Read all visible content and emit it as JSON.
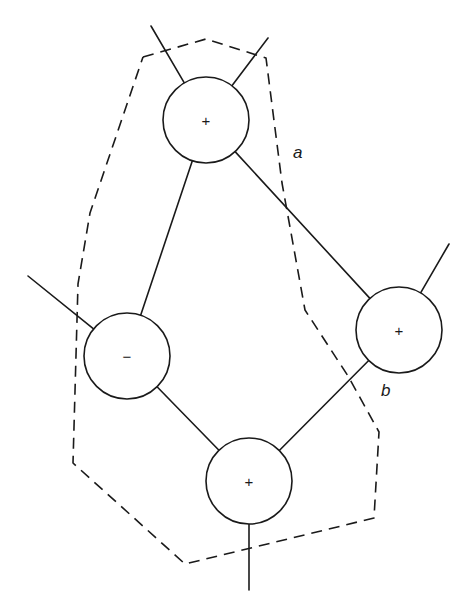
{
  "diagram": {
    "width": 476,
    "height": 611,
    "stroke_color": "#1a1a1a",
    "background": "#ffffff",
    "node_radius": 43,
    "nodes": [
      {
        "id": "top",
        "sign": "+",
        "cx": 206,
        "cy": 120
      },
      {
        "id": "left",
        "sign": "−",
        "cx": 127,
        "cy": 356
      },
      {
        "id": "right",
        "sign": "+",
        "cx": 399,
        "cy": 330
      },
      {
        "id": "bottom",
        "sign": "+",
        "cx": 249,
        "cy": 481
      }
    ],
    "edges": [
      {
        "from": "top",
        "to": "left"
      },
      {
        "from": "top",
        "to": "right"
      },
      {
        "from": "left",
        "to": "bottom"
      },
      {
        "from": "right",
        "to": "bottom"
      }
    ],
    "stubs": [
      {
        "node": "top",
        "x": 151,
        "y": 26
      },
      {
        "node": "top",
        "x": 268,
        "y": 38
      },
      {
        "node": "left",
        "x": 28,
        "y": 276
      },
      {
        "node": "right",
        "x": 449,
        "y": 244
      },
      {
        "node": "bottom",
        "x": 249,
        "y": 590
      }
    ],
    "cut_polygon": [
      [
        143,
        57
      ],
      [
        206,
        39
      ],
      [
        266,
        58
      ],
      [
        282,
        183
      ],
      [
        305,
        310
      ],
      [
        348,
        376
      ],
      [
        379,
        432
      ],
      [
        374,
        518
      ],
      [
        185,
        564
      ],
      [
        73,
        463
      ],
      [
        78,
        284
      ],
      [
        90,
        213
      ],
      [
        143,
        57
      ]
    ],
    "labels": [
      {
        "id": "a",
        "text": "a",
        "x": 293,
        "y": 158
      },
      {
        "id": "b",
        "text": "b",
        "x": 381,
        "y": 396
      }
    ]
  }
}
